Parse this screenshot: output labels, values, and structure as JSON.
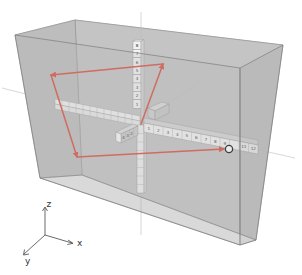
{
  "diagram": {
    "colors": {
      "background": "#ffffff",
      "box_face": "#bfbfbf",
      "box_edge": "#7a7a7a",
      "cube_fill": "#f4f4f4",
      "cube_edge": "#8a8a8a",
      "arrow": "#d9503f",
      "guide_line": "#c8c8c8"
    },
    "vertical_axis_labels": [
      "1",
      "2",
      "3",
      "4",
      "5",
      "6",
      "7",
      "8"
    ],
    "horizontal_axis_labels": [
      "1",
      "2",
      "3",
      "4",
      "5",
      "6",
      "7",
      "8",
      "9",
      "10",
      "11",
      "12"
    ],
    "depth_axis_labels": [
      "2",
      "3",
      "4"
    ],
    "target_marker": "circle-at-10",
    "legend": {
      "z": "z",
      "x": "x",
      "y": "y"
    }
  }
}
